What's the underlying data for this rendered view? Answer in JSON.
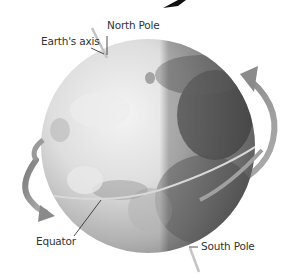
{
  "diagram": {
    "labels": {
      "earth_axis": "Earth's axis",
      "north_pole": "North Pole",
      "equator": "Equator",
      "south_pole": "South Pole"
    },
    "colors": {
      "background": "#ffffff",
      "globe_light": "#f0f0f0",
      "globe_mid": "#c8c8c8",
      "globe_dark": "#6e6e6e",
      "axis": "#c4c4c4",
      "arrow": "#8c8c8c",
      "leader_line": "#222222",
      "text": "#333333"
    },
    "icons": [
      "rotation-arrow-top-right",
      "rotation-arrow-bottom-left"
    ]
  }
}
